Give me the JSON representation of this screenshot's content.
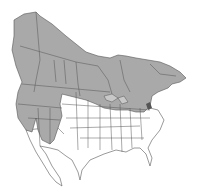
{
  "map": {
    "type": "species-range-map",
    "region": "North America",
    "colors": {
      "background": "#ffffff",
      "range_fill": "#a9a9a9",
      "outside_fill": "#ffffff",
      "border": "#555555",
      "dark_patch": "#555555"
    },
    "legend": []
  }
}
